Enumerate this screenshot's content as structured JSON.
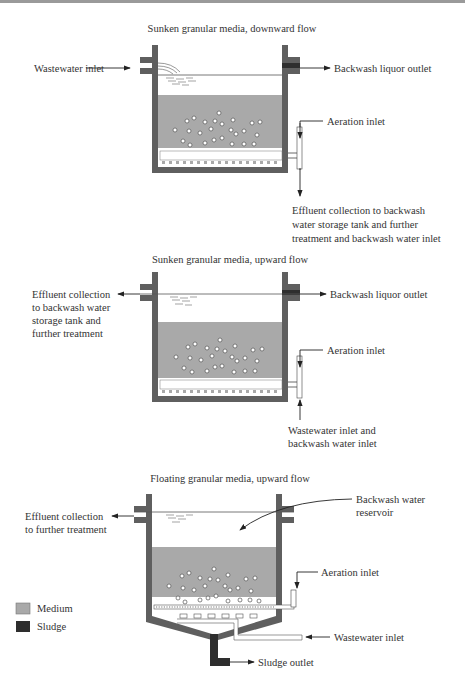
{
  "colors": {
    "wall": "#5f5f5f",
    "medium": "#a9a9a9",
    "sludge": "#2e2e2e",
    "line": "#222222",
    "text": "#333333"
  },
  "panels": [
    {
      "title": "Sunken granular media, downward flow",
      "labels": {
        "left_inlet": "Wastewater inlet",
        "right_outlet": "Backwash liquor outlet",
        "aeration": "Aeration inlet",
        "bottom": [
          "Effluent collection to backwash",
          "water storage tank and further",
          "treatment and backwash water inlet"
        ]
      }
    },
    {
      "title": "Sunken granular media, upward flow",
      "labels": {
        "left_outlet": [
          "Effluent collection",
          "to backwash water",
          "storage tank and",
          "further treatment"
        ],
        "right_outlet": "Backwash liquor outlet",
        "aeration": "Aeration inlet",
        "bottom": [
          "Wastewater inlet and",
          "backwash water inlet"
        ]
      }
    },
    {
      "title": "Floating granular media, upward flow",
      "labels": {
        "left_outlet": [
          "Effluent collection",
          "to further treatment"
        ],
        "reservoir": [
          "Backwash water",
          "reservoir"
        ],
        "aeration": "Aeration inlet",
        "wastewater": "Wastewater inlet",
        "sludge": "Sludge outlet"
      }
    }
  ],
  "legend": [
    {
      "label": "Medium",
      "color": "#a9a9a9"
    },
    {
      "label": "Sludge",
      "color": "#2e2e2e"
    }
  ]
}
